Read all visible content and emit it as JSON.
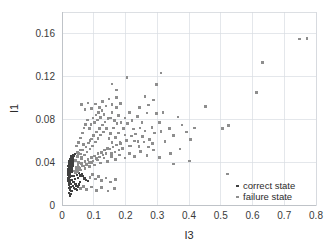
{
  "chart_data": {
    "type": "scatter",
    "title": "",
    "xlabel": "I3",
    "ylabel": "I1",
    "xlim": [
      0,
      0.8
    ],
    "ylim": [
      0,
      0.18
    ],
    "xticks": [
      "0",
      "0.1",
      "0.2",
      "0.3",
      "0.4",
      "0.5",
      "0.6",
      "0.7",
      "0.8"
    ],
    "xtick_values": [
      0,
      0.1,
      0.2,
      0.3,
      0.4,
      0.5,
      0.6,
      0.7,
      0.8
    ],
    "yticks": [
      "0",
      "0.04",
      "0.08",
      "0.12",
      "0.16"
    ],
    "ytick_values": [
      0,
      0.04,
      0.08,
      0.12,
      0.16
    ],
    "grid": true,
    "legend_position": "bottom-right",
    "series": [
      {
        "name": "correct state",
        "color": "#404040",
        "marker": "square",
        "marker_size": 2.2,
        "points": [
          [
            0.021,
            0.0155
          ],
          [
            0.022,
            0.0185
          ],
          [
            0.0225,
            0.021
          ],
          [
            0.0205,
            0.023
          ],
          [
            0.023,
            0.0245
          ],
          [
            0.0215,
            0.026
          ],
          [
            0.024,
            0.0275
          ],
          [
            0.0222,
            0.0288
          ],
          [
            0.0235,
            0.0302
          ],
          [
            0.0248,
            0.0315
          ],
          [
            0.0228,
            0.0325
          ],
          [
            0.0252,
            0.0338
          ],
          [
            0.0238,
            0.0348
          ],
          [
            0.0262,
            0.0358
          ],
          [
            0.0245,
            0.0368
          ],
          [
            0.0268,
            0.0378
          ],
          [
            0.0255,
            0.0388
          ],
          [
            0.0275,
            0.0398
          ],
          [
            0.0262,
            0.0408
          ],
          [
            0.0285,
            0.0418
          ],
          [
            0.027,
            0.0428
          ],
          [
            0.0295,
            0.0438
          ],
          [
            0.0278,
            0.0132
          ],
          [
            0.0258,
            0.0145
          ],
          [
            0.0268,
            0.0168
          ],
          [
            0.0288,
            0.0195
          ],
          [
            0.0242,
            0.0215
          ],
          [
            0.0298,
            0.0232
          ],
          [
            0.0262,
            0.0258
          ],
          [
            0.0305,
            0.0272
          ],
          [
            0.0248,
            0.0292
          ],
          [
            0.0312,
            0.0305
          ],
          [
            0.0272,
            0.0318
          ],
          [
            0.0318,
            0.0332
          ],
          [
            0.0282,
            0.0342
          ],
          [
            0.0325,
            0.0352
          ],
          [
            0.029,
            0.0362
          ],
          [
            0.0332,
            0.0372
          ],
          [
            0.0302,
            0.0382
          ],
          [
            0.0338,
            0.0392
          ],
          [
            0.0195,
            0.0222
          ],
          [
            0.0188,
            0.0252
          ],
          [
            0.0198,
            0.0285
          ],
          [
            0.0192,
            0.0312
          ],
          [
            0.0202,
            0.0338
          ],
          [
            0.0185,
            0.0362
          ],
          [
            0.0208,
            0.0385
          ],
          [
            0.0212,
            0.0405
          ],
          [
            0.0345,
            0.0412
          ],
          [
            0.0355,
            0.0425
          ],
          [
            0.0318,
            0.0445
          ],
          [
            0.0288,
            0.0452
          ],
          [
            0.0385,
            0.0268
          ],
          [
            0.0412,
            0.0242
          ],
          [
            0.0362,
            0.0215
          ],
          [
            0.0428,
            0.0198
          ],
          [
            0.0472,
            0.0282
          ],
          [
            0.0505,
            0.0255
          ],
          [
            0.0445,
            0.0312
          ],
          [
            0.0528,
            0.0302
          ],
          [
            0.0585,
            0.0275
          ],
          [
            0.0622,
            0.0292
          ],
          [
            0.0665,
            0.0268
          ],
          [
            0.0708,
            0.0248
          ],
          [
            0.0752,
            0.0232
          ],
          [
            0.0812,
            0.0222
          ],
          [
            0.0365,
            0.0462
          ],
          [
            0.0418,
            0.0478
          ],
          [
            0.0232,
            0.0112
          ],
          [
            0.0285,
            0.0102
          ],
          [
            0.0318,
            0.0128
          ],
          [
            0.0252,
            0.0088
          ],
          [
            0.0452,
            0.0182
          ],
          [
            0.0495,
            0.0172
          ],
          [
            0.0532,
            0.0192
          ],
          [
            0.0568,
            0.0212
          ],
          [
            0.0352,
            0.0178
          ],
          [
            0.0388,
            0.0162
          ],
          [
            0.0422,
            0.0152
          ],
          [
            0.0468,
            0.0142
          ],
          [
            0.0275,
            0.0352
          ],
          [
            0.0298,
            0.0348
          ],
          [
            0.0312,
            0.0362
          ],
          [
            0.0335,
            0.0368
          ],
          [
            0.0258,
            0.0415
          ],
          [
            0.0282,
            0.0422
          ],
          [
            0.0305,
            0.0432
          ],
          [
            0.0328,
            0.0442
          ]
        ]
      },
      {
        "name": "failure state",
        "color": "#8e8e8e",
        "marker": "square",
        "marker_size": 2.6,
        "points": [
          [
            0.042,
            0.0415
          ],
          [
            0.048,
            0.0452
          ],
          [
            0.052,
            0.0398
          ],
          [
            0.058,
            0.0475
          ],
          [
            0.062,
            0.0432
          ],
          [
            0.066,
            0.0512
          ],
          [
            0.071,
            0.0468
          ],
          [
            0.075,
            0.0542
          ],
          [
            0.079,
            0.0495
          ],
          [
            0.083,
            0.0578
          ],
          [
            0.088,
            0.0522
          ],
          [
            0.092,
            0.0615
          ],
          [
            0.096,
            0.0552
          ],
          [
            0.101,
            0.0648
          ],
          [
            0.105,
            0.0588
          ],
          [
            0.109,
            0.0682
          ],
          [
            0.114,
            0.0618
          ],
          [
            0.118,
            0.0712
          ],
          [
            0.122,
            0.0652
          ],
          [
            0.127,
            0.0745
          ],
          [
            0.131,
            0.0682
          ],
          [
            0.136,
            0.0775
          ],
          [
            0.141,
            0.0715
          ],
          [
            0.145,
            0.0808
          ],
          [
            0.045,
            0.0352
          ],
          [
            0.051,
            0.0372
          ],
          [
            0.056,
            0.0342
          ],
          [
            0.061,
            0.0388
          ],
          [
            0.067,
            0.0362
          ],
          [
            0.072,
            0.0408
          ],
          [
            0.077,
            0.0378
          ],
          [
            0.082,
            0.0422
          ],
          [
            0.087,
            0.0398
          ],
          [
            0.093,
            0.0442
          ],
          [
            0.098,
            0.0412
          ],
          [
            0.103,
            0.0458
          ],
          [
            0.108,
            0.0432
          ],
          [
            0.113,
            0.0478
          ],
          [
            0.118,
            0.0448
          ],
          [
            0.124,
            0.0492
          ],
          [
            0.129,
            0.0465
          ],
          [
            0.134,
            0.0512
          ],
          [
            0.139,
            0.0482
          ],
          [
            0.144,
            0.0528
          ],
          [
            0.052,
            0.0582
          ],
          [
            0.058,
            0.0625
          ],
          [
            0.064,
            0.0672
          ],
          [
            0.069,
            0.0718
          ],
          [
            0.074,
            0.0752
          ],
          [
            0.081,
            0.0792
          ],
          [
            0.086,
            0.0712
          ],
          [
            0.091,
            0.0752
          ],
          [
            0.097,
            0.0812
          ],
          [
            0.102,
            0.0768
          ],
          [
            0.107,
            0.0838
          ],
          [
            0.112,
            0.0792
          ],
          [
            0.115,
            0.0862
          ],
          [
            0.121,
            0.0818
          ],
          [
            0.126,
            0.0882
          ],
          [
            0.132,
            0.0842
          ],
          [
            0.148,
            0.0618
          ],
          [
            0.153,
            0.0668
          ],
          [
            0.158,
            0.0582
          ],
          [
            0.163,
            0.0718
          ],
          [
            0.168,
            0.0628
          ],
          [
            0.173,
            0.0762
          ],
          [
            0.178,
            0.0672
          ],
          [
            0.183,
            0.0582
          ],
          [
            0.149,
            0.0522
          ],
          [
            0.155,
            0.0478
          ],
          [
            0.161,
            0.0542
          ],
          [
            0.167,
            0.0495
          ],
          [
            0.172,
            0.0558
          ],
          [
            0.179,
            0.0512
          ],
          [
            0.185,
            0.0572
          ],
          [
            0.191,
            0.0528
          ],
          [
            0.152,
            0.0812
          ],
          [
            0.158,
            0.0862
          ],
          [
            0.165,
            0.0788
          ],
          [
            0.171,
            0.0912
          ],
          [
            0.178,
            0.0832
          ],
          [
            0.186,
            0.0768
          ],
          [
            0.193,
            0.0712
          ],
          [
            0.198,
            0.0652
          ],
          [
            0.204,
            0.0602
          ],
          [
            0.211,
            0.0552
          ],
          [
            0.218,
            0.0642
          ],
          [
            0.225,
            0.0708
          ],
          [
            0.198,
            0.0812
          ],
          [
            0.206,
            0.0758
          ],
          [
            0.213,
            0.0862
          ],
          [
            0.221,
            0.0788
          ],
          [
            0.232,
            0.0662
          ],
          [
            0.239,
            0.0592
          ],
          [
            0.246,
            0.0718
          ],
          [
            0.254,
            0.0638
          ],
          [
            0.237,
            0.0828
          ],
          [
            0.244,
            0.0912
          ],
          [
            0.252,
            0.0772
          ],
          [
            0.261,
            0.0692
          ],
          [
            0.268,
            0.0858
          ],
          [
            0.276,
            0.0612
          ],
          [
            0.283,
            0.0722
          ],
          [
            0.291,
            0.0672
          ],
          [
            0.262,
            0.1012
          ],
          [
            0.272,
            0.0932
          ],
          [
            0.288,
            0.0978
          ],
          [
            0.298,
            0.0852
          ],
          [
            0.308,
            0.0768
          ],
          [
            0.318,
            0.0862
          ],
          [
            0.298,
            0.1122
          ],
          [
            0.312,
            0.0688
          ],
          [
            0.325,
            0.0592
          ],
          [
            0.338,
            0.0712
          ],
          [
            0.352,
            0.0648
          ],
          [
            0.365,
            0.0822
          ],
          [
            0.378,
            0.0748
          ],
          [
            0.392,
            0.0682
          ],
          [
            0.405,
            0.0612
          ],
          [
            0.418,
            0.0718
          ],
          [
            0.372,
            0.0522
          ],
          [
            0.342,
            0.0482
          ],
          [
            0.308,
            0.0442
          ],
          [
            0.288,
            0.0512
          ],
          [
            0.268,
            0.0462
          ],
          [
            0.248,
            0.0498
          ],
          [
            0.228,
            0.0452
          ],
          [
            0.212,
            0.0482
          ],
          [
            0.198,
            0.0438
          ],
          [
            0.182,
            0.0468
          ],
          [
            0.168,
            0.0425
          ],
          [
            0.155,
            0.0452
          ],
          [
            0.143,
            0.0408
          ],
          [
            0.132,
            0.0438
          ],
          [
            0.122,
            0.0392
          ],
          [
            0.112,
            0.0418
          ],
          [
            0.102,
            0.0372
          ],
          [
            0.094,
            0.0398
          ],
          [
            0.086,
            0.0358
          ],
          [
            0.078,
            0.0382
          ],
          [
            0.072,
            0.0342
          ],
          [
            0.065,
            0.0365
          ],
          [
            0.059,
            0.0328
          ],
          [
            0.054,
            0.0348
          ],
          [
            0.049,
            0.0312
          ],
          [
            0.045,
            0.0332
          ],
          [
            0.042,
            0.0298
          ],
          [
            0.039,
            0.0318
          ],
          [
            0.088,
            0.0258
          ],
          [
            0.096,
            0.0282
          ],
          [
            0.105,
            0.0242
          ],
          [
            0.115,
            0.0268
          ],
          [
            0.125,
            0.0228
          ],
          [
            0.138,
            0.0252
          ],
          [
            0.152,
            0.0215
          ],
          [
            0.168,
            0.0238
          ],
          [
            0.062,
            0.0938
          ],
          [
            0.072,
            0.0888
          ],
          [
            0.082,
            0.0952
          ],
          [
            0.092,
            0.0898
          ],
          [
            0.105,
            0.0942
          ],
          [
            0.118,
            0.0908
          ],
          [
            0.128,
            0.0968
          ],
          [
            0.138,
            0.0922
          ],
          [
            0.148,
            0.0988
          ],
          [
            0.158,
            0.0938
          ],
          [
            0.172,
            0.1002
          ],
          [
            0.185,
            0.0948
          ],
          [
            0.205,
            0.1188
          ],
          [
            0.312,
            0.1232
          ],
          [
            0.452,
            0.0918
          ],
          [
            0.505,
            0.0712
          ],
          [
            0.525,
            0.0742
          ],
          [
            0.612,
            0.1048
          ],
          [
            0.632,
            0.1328
          ],
          [
            0.748,
            0.1548
          ],
          [
            0.772,
            0.1552
          ],
          [
            0.522,
            0.0288
          ],
          [
            0.402,
            0.0412
          ],
          [
            0.352,
            0.0382
          ],
          [
            0.058,
            0.0152
          ],
          [
            0.068,
            0.0172
          ],
          [
            0.078,
            0.0142
          ],
          [
            0.092,
            0.0168
          ],
          [
            0.108,
            0.0138
          ],
          [
            0.125,
            0.0162
          ],
          [
            0.145,
            0.0132
          ],
          [
            0.165,
            0.0155
          ],
          [
            0.088,
            0.0602
          ],
          [
            0.098,
            0.0648
          ],
          [
            0.068,
            0.0562
          ],
          [
            0.058,
            0.0512
          ],
          [
            0.048,
            0.0488
          ],
          [
            0.045,
            0.0552
          ],
          [
            0.052,
            0.0478
          ],
          [
            0.062,
            0.0442
          ],
          [
            0.215,
            0.0552
          ],
          [
            0.228,
            0.0598
          ],
          [
            0.242,
            0.0548
          ],
          [
            0.258,
            0.0588
          ],
          [
            0.272,
            0.0542
          ],
          [
            0.285,
            0.0572
          ],
          [
            0.172,
            0.1072
          ],
          [
            0.158,
            0.1128
          ]
        ]
      }
    ]
  },
  "legend": {
    "entries": [
      {
        "label": "correct state",
        "color": "#404040"
      },
      {
        "label": "failure state",
        "color": "#8e8e8e"
      }
    ]
  }
}
